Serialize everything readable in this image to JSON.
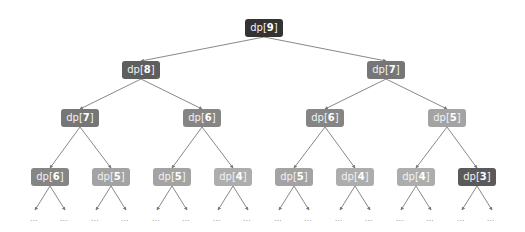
{
  "diagram": {
    "title": "",
    "type": "recursion-tree",
    "node_prefix": "dp[",
    "node_suffix": "]",
    "ellipsis": "…",
    "edge_color": "#7a7a7a",
    "nodes": [
      {
        "id": "n9",
        "index": "9",
        "level": 0,
        "cx": 264,
        "cy": 28,
        "w": 38,
        "color": "#333333"
      },
      {
        "id": "n8",
        "index": "8",
        "level": 1,
        "cx": 141,
        "cy": 70,
        "w": 38,
        "color": "#5e5e5e",
        "parent": "n9"
      },
      {
        "id": "n7a",
        "index": "7",
        "level": 1,
        "cx": 386,
        "cy": 70,
        "w": 38,
        "color": "#767676",
        "parent": "n9"
      },
      {
        "id": "n7b",
        "index": "7",
        "level": 2,
        "cx": 80,
        "cy": 118,
        "w": 38,
        "color": "#767676",
        "parent": "n8"
      },
      {
        "id": "n6a",
        "index": "6",
        "level": 2,
        "cx": 202,
        "cy": 118,
        "w": 38,
        "color": "#858585",
        "parent": "n8"
      },
      {
        "id": "n6b",
        "index": "6",
        "level": 2,
        "cx": 325,
        "cy": 118,
        "w": 38,
        "color": "#858585",
        "parent": "n7a"
      },
      {
        "id": "n5a",
        "index": "5",
        "level": 2,
        "cx": 447,
        "cy": 118,
        "w": 38,
        "color": "#a3a3a3",
        "parent": "n7a"
      },
      {
        "id": "n6c",
        "index": "6",
        "level": 3,
        "cx": 50,
        "cy": 177,
        "w": 38,
        "color": "#858585",
        "parent": "n7b"
      },
      {
        "id": "n5b",
        "index": "5",
        "level": 3,
        "cx": 111,
        "cy": 177,
        "w": 38,
        "color": "#a3a3a3",
        "parent": "n7b"
      },
      {
        "id": "n5c",
        "index": "5",
        "level": 3,
        "cx": 172,
        "cy": 177,
        "w": 38,
        "color": "#a3a3a3",
        "parent": "n6a"
      },
      {
        "id": "n4a",
        "index": "4",
        "level": 3,
        "cx": 233,
        "cy": 177,
        "w": 38,
        "color": "#adadad",
        "parent": "n6a"
      },
      {
        "id": "n5d",
        "index": "5",
        "level": 3,
        "cx": 294,
        "cy": 177,
        "w": 38,
        "color": "#a3a3a3",
        "parent": "n6b"
      },
      {
        "id": "n4b",
        "index": "4",
        "level": 3,
        "cx": 355,
        "cy": 177,
        "w": 38,
        "color": "#adadad",
        "parent": "n6b"
      },
      {
        "id": "n4c",
        "index": "4",
        "level": 3,
        "cx": 416,
        "cy": 177,
        "w": 38,
        "color": "#adadad",
        "parent": "n5a"
      },
      {
        "id": "n3",
        "index": "3",
        "level": 3,
        "cx": 477,
        "cy": 177,
        "w": 38,
        "color": "#5a5a5a",
        "parent": "n5a"
      }
    ],
    "leaf_ellipsis_y": 219,
    "leaf_arrow_tip_y": 210,
    "leaf_child_offset": 15
  }
}
